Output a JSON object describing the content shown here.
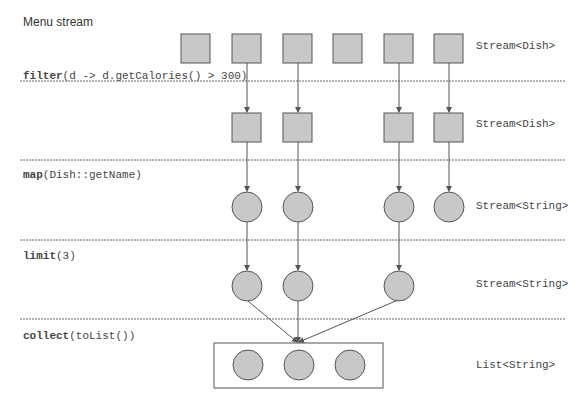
{
  "title": "Menu stream",
  "operations": [
    {
      "name": "filter",
      "args": "(d -> d.getCalories() > 300)"
    },
    {
      "name": "map",
      "args": "(Dish::getName)"
    },
    {
      "name": "limit",
      "args": "(3)"
    },
    {
      "name": "collect",
      "args": "(toList())"
    }
  ],
  "types": [
    "Stream<Dish>",
    "Stream<Dish>",
    "Stream<String>",
    "Stream<String>",
    "List<String>"
  ],
  "colors": {
    "shape_fill": "#c8c8c8",
    "shape_stroke": "#555555",
    "line": "#555555",
    "divider": "#666666"
  }
}
